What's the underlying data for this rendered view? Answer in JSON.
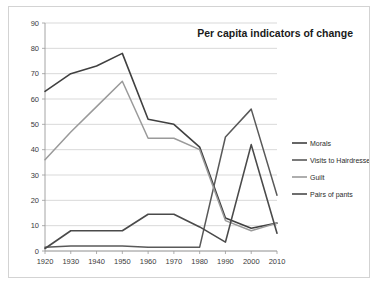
{
  "figure": {
    "background": "#ffffff",
    "border_color": "#d3d3d3"
  },
  "chart_data": {
    "type": "line",
    "title": "Per capita indicators of change",
    "xlabel": "",
    "ylabel": "",
    "x": [
      1920,
      1930,
      1940,
      1950,
      1960,
      1970,
      1980,
      1990,
      2000,
      2010
    ],
    "categories": [
      "1920",
      "1930",
      "1940",
      "1950",
      "1960",
      "1970",
      "1980",
      "1990",
      "2000",
      "2010"
    ],
    "xlim": [
      1920,
      2010
    ],
    "ylim": [
      0,
      90
    ],
    "yticks": [
      0,
      10,
      20,
      30,
      40,
      50,
      60,
      70,
      80,
      90
    ],
    "ytick_labels": [
      "0",
      "10",
      "20",
      "30",
      "40",
      "50",
      "60",
      "70",
      "80",
      "90"
    ],
    "grid": true,
    "grid_axis": "y",
    "legend_position": "right",
    "series": [
      {
        "name": "Morals",
        "color": "#404040",
        "width": 1.6,
        "values": [
          63,
          70,
          73,
          78,
          52,
          50,
          41,
          13,
          9,
          11
        ]
      },
      {
        "name": "Visits to Hairdresser",
        "color": "#595959",
        "width": 1.5,
        "values": [
          1.5,
          2,
          2,
          2,
          1.5,
          1.5,
          1.5,
          45,
          56,
          22
        ]
      },
      {
        "name": "Guilt",
        "color": "#9a9a9a",
        "width": 1.5,
        "values": [
          36,
          47,
          57,
          67,
          44.5,
          44.5,
          40,
          12,
          8,
          11
        ]
      },
      {
        "name": "Pairs of pants",
        "color": "#4a4a4a",
        "width": 1.6,
        "values": [
          1,
          8,
          8,
          8,
          14.5,
          14.5,
          9.5,
          3.5,
          42,
          7
        ]
      }
    ]
  }
}
